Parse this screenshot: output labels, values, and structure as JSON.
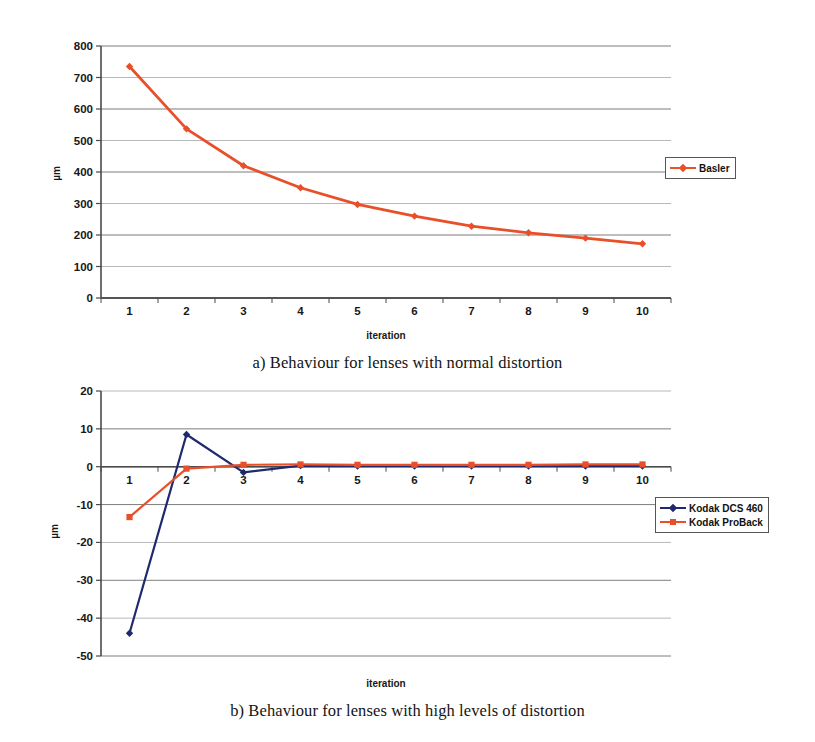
{
  "figure_a": {
    "caption": "a) Behaviour for lenses with normal distortion",
    "chart_data": {
      "type": "line",
      "title": "",
      "xlabel": "iteration",
      "ylabel": "µm",
      "x": [
        1,
        2,
        3,
        4,
        5,
        6,
        7,
        8,
        9,
        10
      ],
      "xticklabels": [
        "1",
        "2",
        "3",
        "4",
        "5",
        "6",
        "7",
        "8",
        "9",
        "10"
      ],
      "yticklabels": [
        "0",
        "100",
        "200",
        "300",
        "400",
        "500",
        "600",
        "700",
        "800"
      ],
      "ylim": [
        0,
        800
      ],
      "ytick_step": 100,
      "grid": "horizontal",
      "legend_position": "right",
      "series": [
        {
          "name": "Basler",
          "color": "#E8502A",
          "marker": "diamond",
          "values": [
            735,
            537,
            420,
            350,
            297,
            260,
            228,
            207,
            190,
            172
          ]
        }
      ]
    }
  },
  "figure_b": {
    "caption": "b) Behaviour for lenses with high levels of distortion",
    "chart_data": {
      "type": "line",
      "title": "",
      "xlabel": "iteration",
      "ylabel": "µm",
      "x": [
        1,
        2,
        3,
        4,
        5,
        6,
        7,
        8,
        9,
        10
      ],
      "xticklabels": [
        "1",
        "2",
        "3",
        "4",
        "5",
        "6",
        "7",
        "8",
        "9",
        "10"
      ],
      "yticklabels": [
        "-50",
        "-40",
        "-30",
        "-20",
        "-10",
        "0",
        "10",
        "20"
      ],
      "ylim": [
        -50,
        20
      ],
      "ytick_step": 10,
      "grid": "horizontal",
      "legend_position": "right",
      "series": [
        {
          "name": "Kodak DCS 460",
          "color": "#1F2A6E",
          "marker": "diamond",
          "values": [
            -44.0,
            8.5,
            -1.5,
            0.3,
            0.2,
            0.2,
            0.2,
            0.2,
            0.2,
            0.2
          ]
        },
        {
          "name": "Kodak ProBack",
          "color": "#E8502A",
          "marker": "square",
          "values": [
            -13.3,
            -0.5,
            0.5,
            0.6,
            0.5,
            0.5,
            0.5,
            0.5,
            0.6,
            0.6
          ]
        }
      ]
    }
  },
  "colors": {
    "basler": "#E8502A",
    "kodak_dcs_460": "#1F2A6E",
    "kodak_proback": "#E8502A",
    "axis": "#555555",
    "grid": "#9a9a9a",
    "text": "#181818"
  }
}
